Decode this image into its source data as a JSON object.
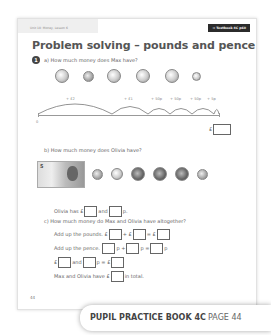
{
  "header": {
    "unit_label": "Unit 10: Money, Lesson 6",
    "textbook_ref": "→ Textbook 4C p60",
    "title": "Problem solving – pounds and pence"
  },
  "question": {
    "number": "1",
    "part_a": {
      "prompt": "a)  How much money does Max have?",
      "coins": [
        "£2",
        "£1",
        "50p",
        "50p",
        "50p",
        "5p"
      ],
      "number_line": {
        "start_label": "0",
        "hops": [
          "+ £2",
          "+ £1",
          "+ 50p",
          "+ 50p",
          "+ 50p",
          "+ 5p"
        ],
        "answer_prefix": "£"
      }
    },
    "part_b": {
      "prompt": "b)  How much money does Olivia have?",
      "money": [
        "£5 note",
        "20p",
        "10p",
        "£1",
        "£1",
        "£1",
        "5p"
      ],
      "answer_line": {
        "t1": "Olivia has £",
        "t2": "and",
        "t3": "p."
      }
    },
    "part_c": {
      "prompt": "c)  How much money do Max and Olivia have altogether?",
      "pounds_line": {
        "label": "Add up the pounds.",
        "cur1": "£",
        "plus": "+ £",
        "eq": "= £"
      },
      "pence_line": {
        "label": "Add up the pence.",
        "p1": "p +",
        "p2": "p =",
        "p3": "p"
      },
      "combine_line": {
        "cur": "£",
        "and": "and",
        "p_eq": "p = £"
      },
      "total_line": {
        "t1": "Max and Olivia have £",
        "t2": "in total."
      }
    }
  },
  "footer": {
    "page_number": "44",
    "book": "PUPIL PRACTICE BOOK 4C",
    "page": "PAGE 44"
  }
}
